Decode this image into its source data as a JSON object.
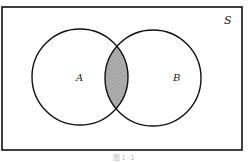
{
  "diagram": {
    "type": "venn",
    "universe_label": "S",
    "sets": [
      {
        "label": "A",
        "cx": 80,
        "cy": 77,
        "r": 48
      },
      {
        "label": "B",
        "cx": 153,
        "cy": 78,
        "r": 48
      }
    ],
    "shaded_region": "A ∩ B",
    "colors": {
      "stroke": "#111111",
      "shade": "#a9a9a9",
      "background": "#ffffff"
    },
    "caption": "图1-1"
  }
}
